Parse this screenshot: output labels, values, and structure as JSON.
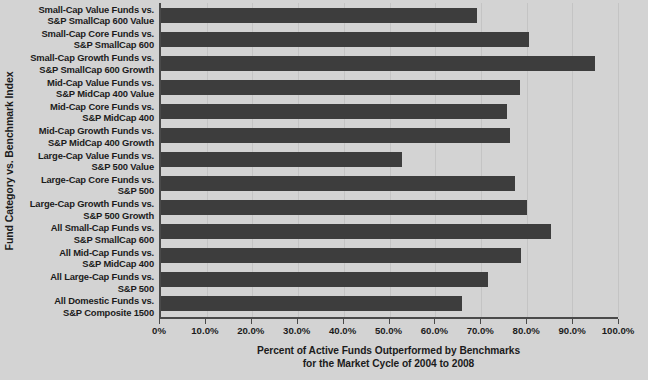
{
  "chart_data": {
    "type": "bar",
    "orientation": "horizontal",
    "title": "",
    "xlabel": "Percent of Active Funds Outperformed by Benchmarks for the Market Cycle of 2004 to 2008",
    "xlabel_lines": [
      "Percent of Active Funds Outperformed by Benchmarks",
      "for the Market Cycle of 2004 to 2008"
    ],
    "ylabel": "Fund Category vs. Benchmark Index",
    "xlim": [
      0,
      100
    ],
    "ylim": null,
    "grid": true,
    "legend": false,
    "legend_position": "none",
    "bar_color": "#3d3d3d",
    "background_color": "#d3d3d3",
    "axis_color": "#4a4a4a",
    "xticks": [
      0,
      10,
      20,
      30,
      40,
      50,
      60,
      70,
      80,
      90,
      100
    ],
    "xtick_labels": [
      "0%",
      "10.0%",
      "20.0%",
      "30.0%",
      "40.0%",
      "50.0%",
      "60.0%",
      "70.0%",
      "80.0%",
      "90.0%",
      "100.0%"
    ],
    "categories": [
      "Small-Cap Value Funds vs. S&P SmallCap 600 Value",
      "Small-Cap Core Funds vs. S&P SmallCap 600",
      "Small-Cap Growth Funds vs. S&P SmallCap 600 Growth",
      "Mid-Cap Value Funds vs. S&P MidCap 400 Value",
      "Mid-Cap Core Funds vs. S&P MidCap 400",
      "Mid-Cap Growth Funds vs. S&P MidCap 400 Growth",
      "Large-Cap Value Funds vs. S&P 500 Value",
      "Large-Cap Core Funds vs. S&P 500",
      "Large-Cap Growth Funds vs. S&P 500 Growth",
      "All Small-Cap Funds vs. S&P SmallCap 600",
      "All Mid-Cap Funds vs. S&P MidCap 400",
      "All Large-Cap Funds vs. S&P 500",
      "All Domestic Funds vs. S&P Composite 1500"
    ],
    "category_label_lines": [
      [
        "Small-Cap Value Funds vs.",
        "S&P SmallCap 600 Value"
      ],
      [
        "Small-Cap Core Funds vs.",
        "S&P SmallCap 600"
      ],
      [
        "Small-Cap Growth Funds vs.",
        "S&P SmallCap 600 Growth"
      ],
      [
        "Mid-Cap Value Funds vs.",
        "S&P MidCap 400 Value"
      ],
      [
        "Mid-Cap Core Funds vs.",
        "S&P MidCap 400"
      ],
      [
        "Mid-Cap Growth Funds vs.",
        "S&P MidCap 400 Growth"
      ],
      [
        "Large-Cap Value Funds vs.",
        "S&P 500 Value"
      ],
      [
        "Large-Cap Core Funds vs.",
        "S&P 500"
      ],
      [
        "Large-Cap Growth Funds vs.",
        "S&P 500 Growth"
      ],
      [
        "All Small-Cap Funds vs.",
        "S&P SmallCap 600"
      ],
      [
        "All Mid-Cap Funds vs.",
        "S&P MidCap 400"
      ],
      [
        "All Large-Cap Funds vs.",
        "S&P 500"
      ],
      [
        "All Domestic Funds vs.",
        "S&P Composite 1500"
      ]
    ],
    "values": [
      69.2,
      80.6,
      95.0,
      78.6,
      75.8,
      76.4,
      52.8,
      77.5,
      80.1,
      85.4,
      78.8,
      71.6,
      65.9
    ]
  }
}
